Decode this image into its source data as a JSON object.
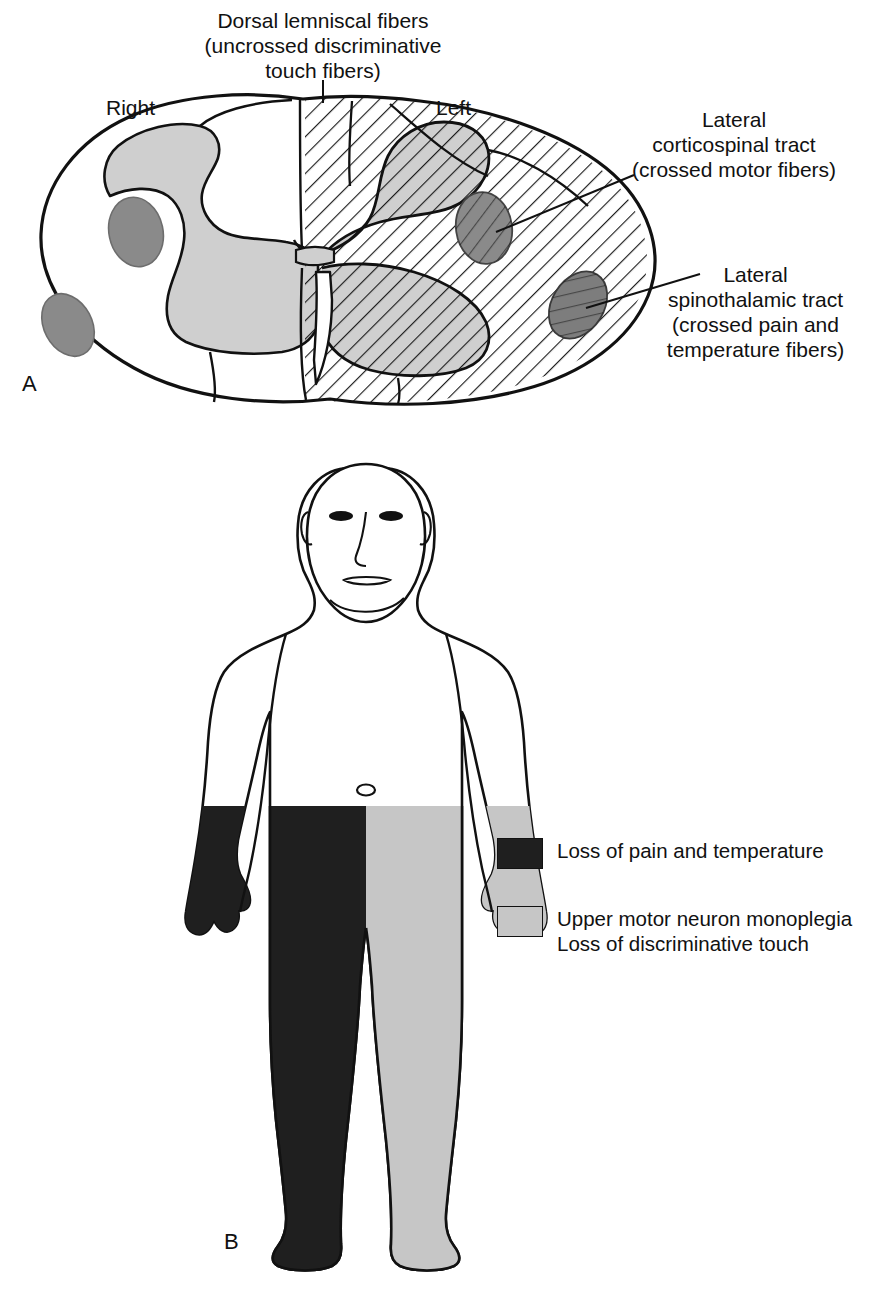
{
  "figure": {
    "panel_a": {
      "letter": "A",
      "side_labels": {
        "right": "Right",
        "left": "Left"
      },
      "callouts": [
        {
          "name": "dorsal-lemniscal",
          "text": "Dorsal lemniscal fibers\n(uncrossed discriminative\ntouch fibers)"
        },
        {
          "name": "lateral-corticospinal",
          "text": "Lateral\ncorticospinal tract\n(crossed motor fibers)"
        },
        {
          "name": "lateral-spinothalamic",
          "text": "Lateral\nspinothalamic tract\n(crossed pain and\ntemperature fibers)"
        }
      ]
    },
    "panel_b": {
      "letter": "B",
      "legend": [
        {
          "swatch_color": "#1f1f1f",
          "text": "Loss of pain and temperature"
        },
        {
          "swatch_color": "#c6c6c6",
          "text": "Upper motor neuron monoplegia\nLoss of discriminative touch"
        }
      ]
    }
  },
  "colors": {
    "outline": "#111111",
    "gray_matter": "#cfcfcf",
    "tract_oval": "#8a8a8a",
    "black_region": "#1f1f1f",
    "gray_region": "#c6c6c6",
    "hatch": "#111111"
  }
}
